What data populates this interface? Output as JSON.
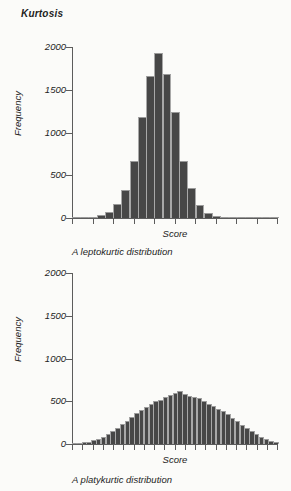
{
  "section": {
    "title": "Kurtosis"
  },
  "charts": [
    {
      "id": "leptokurtic",
      "caption": "A leptokurtic distribution",
      "xlabel": "Score",
      "ylabel": "Frequency",
      "yticks": [
        "0",
        "500",
        "1000",
        "1500",
        "2000"
      ]
    },
    {
      "id": "platykurtic",
      "caption": "A platykurtic distribution",
      "xlabel": "Score",
      "ylabel": "Frequency",
      "yticks": [
        "0",
        "500",
        "1000",
        "1500",
        "2000"
      ]
    }
  ],
  "colors": {
    "bar_fill": "#474747",
    "bar_edge": "#a8a8a8",
    "axis": "#5c5c5c",
    "text": "#1d1d1d",
    "page_background": "#fbfbf9"
  },
  "chart_data": [
    {
      "type": "bar",
      "title": "A leptokurtic distribution",
      "subtitle": "Kurtosis",
      "xlabel": "Score",
      "ylabel": "Frequency",
      "ylim": [
        0,
        2000
      ],
      "ytick_values": [
        0,
        500,
        1000,
        1500,
        2000
      ],
      "grid": false,
      "legend": "none",
      "n_xticks": 11,
      "categories": [
        "b1",
        "b2",
        "b3",
        "b4",
        "b5",
        "b6",
        "b7",
        "b8",
        "b9",
        "b10",
        "b11",
        "b12",
        "b13",
        "b14",
        "b15",
        "b16",
        "b17",
        "b18",
        "b19",
        "b20",
        "b21",
        "b22",
        "b23",
        "b24",
        "b25"
      ],
      "values": [
        5,
        8,
        15,
        30,
        70,
        160,
        330,
        670,
        1180,
        1660,
        1930,
        1680,
        1240,
        670,
        350,
        150,
        60,
        25,
        12,
        8,
        5,
        4,
        3,
        2,
        2
      ]
    },
    {
      "type": "bar",
      "title": "A platykurtic distribution",
      "subtitle": "Kurtosis",
      "xlabel": "Score",
      "ylabel": "Frequency",
      "ylim": [
        0,
        2000
      ],
      "ytick_values": [
        0,
        500,
        1000,
        1500,
        2000
      ],
      "grid": false,
      "legend": "none",
      "n_xticks": 21,
      "categories": [
        "c1",
        "c2",
        "c3",
        "c4",
        "c5",
        "c6",
        "c7",
        "c8",
        "c9",
        "c10",
        "c11",
        "c12",
        "c13",
        "c14",
        "c15",
        "c16",
        "c17",
        "c18",
        "c19",
        "c20",
        "c21",
        "c22",
        "c23",
        "c24",
        "c25",
        "c26",
        "c27",
        "c28",
        "c29",
        "c30",
        "c31",
        "c32",
        "c33",
        "c34",
        "c35",
        "c36",
        "c37",
        "c38",
        "c39",
        "c40",
        "c41",
        "c42",
        "c43"
      ],
      "values": [
        8,
        12,
        18,
        28,
        42,
        60,
        85,
        115,
        150,
        190,
        235,
        275,
        320,
        360,
        395,
        430,
        470,
        500,
        520,
        545,
        570,
        600,
        625,
        585,
        560,
        548,
        540,
        505,
        470,
        440,
        415,
        385,
        350,
        310,
        270,
        225,
        185,
        150,
        115,
        85,
        58,
        38,
        22
      ]
    }
  ]
}
